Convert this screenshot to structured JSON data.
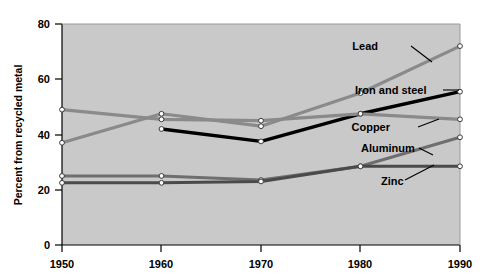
{
  "chart_data": {
    "type": "line",
    "title": "",
    "subtitle": "",
    "xlabel": "",
    "ylabel": "Percent from recycled metal",
    "x": [
      1950,
      1960,
      1970,
      1980,
      1990
    ],
    "xtick_labels": [
      "1950",
      "1960",
      "1970",
      "1980",
      "1990"
    ],
    "ytick_labels": [
      "0",
      "20",
      "40",
      "60",
      "80"
    ],
    "yticks": [
      0,
      20,
      40,
      60,
      80
    ],
    "xlim": [
      1950,
      1990
    ],
    "ylim": [
      0,
      80
    ],
    "grid": false,
    "legend_position": "inline-annotations",
    "plot_background": "#c9c9c9",
    "figure_background": "#ffffff",
    "marker": "open-circle",
    "series": [
      {
        "name": "Lead",
        "label": "Lead",
        "color": "#8a8a8a",
        "width": 3.2,
        "values": [
          37.0,
          47.5,
          43.0,
          55.0,
          72.0
        ]
      },
      {
        "name": "Iron and steel",
        "label": "Iron and steel",
        "color": "#000000",
        "width": 3.4,
        "values": [
          null,
          42.0,
          37.5,
          47.5,
          55.5
        ]
      },
      {
        "name": "Copper",
        "label": "Copper",
        "color": "#8a8a8a",
        "width": 3.2,
        "values": [
          49.0,
          45.5,
          45.0,
          47.5,
          45.5
        ]
      },
      {
        "name": "Aluminum",
        "label": "Aluminum",
        "color": "#6e6e6e",
        "width": 3.0,
        "values": [
          25.0,
          25.0,
          23.5,
          28.5,
          39.0
        ]
      },
      {
        "name": "Zinc",
        "label": "Zinc",
        "color": "#4a4a4a",
        "width": 3.0,
        "values": [
          22.5,
          22.5,
          23.0,
          28.5,
          28.5
        ]
      }
    ],
    "annotations": [
      {
        "name": "Lead",
        "text": "Lead",
        "x": 378,
        "y": 50
      },
      {
        "name": "Iron and steel",
        "text": "Iron and steel",
        "x": 355,
        "y": 94
      },
      {
        "name": "Copper",
        "text": "Copper",
        "x": 375,
        "y": 131
      },
      {
        "name": "Aluminum",
        "text": "Aluminum",
        "x": 361,
        "y": 151
      },
      {
        "name": "Zinc",
        "text": "Zinc",
        "x": 381,
        "y": 184
      }
    ]
  },
  "axis": {
    "y_title": "Percent from recycled metal",
    "y_ticks": [
      "80",
      "60",
      "40",
      "20",
      "0"
    ],
    "x_ticks": [
      "1950",
      "1960",
      "1970",
      "1980",
      "1990"
    ]
  },
  "labels": {
    "lead": "Lead",
    "iron_and_steel": "Iron and steel",
    "copper": "Copper",
    "aluminum": "Aluminum",
    "zinc": "Zinc"
  }
}
